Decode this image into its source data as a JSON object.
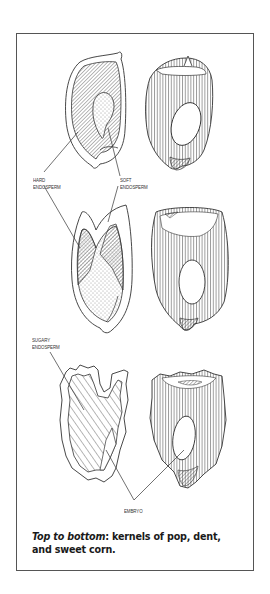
{
  "figure": {
    "panels": [
      {
        "name": "popcorn",
        "views": [
          "cross-section",
          "exterior"
        ],
        "labels": [
          {
            "line1": "HARD",
            "line2": "ENDOSPERM"
          },
          {
            "line1": "SOFT",
            "line2": "ENDOSPERM"
          }
        ]
      },
      {
        "name": "dent corn",
        "views": [
          "cross-section",
          "exterior"
        ]
      },
      {
        "name": "sweet corn",
        "views": [
          "cross-section",
          "exterior"
        ],
        "labels": [
          {
            "line1": "SUGARY",
            "line2": "ENDOSPERM"
          },
          {
            "line1": "EMBRYO"
          }
        ]
      }
    ],
    "caption": {
      "lead": "Top to bottom",
      "rest": ": kernels of pop, dent, and sweet corn."
    },
    "colors": {
      "ink": "#333333",
      "frame": "#555555",
      "background": "#ffffff"
    }
  }
}
